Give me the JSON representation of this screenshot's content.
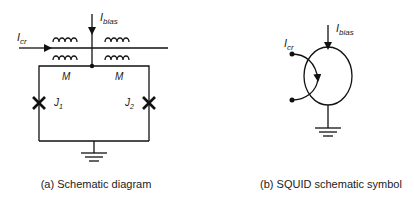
{
  "panel_a": {
    "caption": "(a) Schematic diagram",
    "input_current": {
      "symbol": "I",
      "sub": "cr"
    },
    "bias_current": {
      "symbol": "I",
      "sub": "bias"
    },
    "mutual_left": "M",
    "mutual_right": "M",
    "junction_1": {
      "symbol": "J",
      "sub": "1"
    },
    "junction_2": {
      "symbol": "J",
      "sub": "2"
    }
  },
  "panel_b": {
    "caption": "(b) SQUID schematic symbol",
    "input_current": {
      "symbol": "I",
      "sub": "cr"
    },
    "bias_current": {
      "symbol": "I",
      "sub": "bias"
    }
  },
  "colors": {
    "stroke": "#111111",
    "text": "#1a1a1a"
  }
}
